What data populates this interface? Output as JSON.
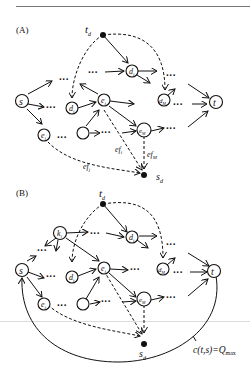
{
  "panels": [
    {
      "id": "A",
      "label": "(A)",
      "nodes": {
        "s": "s",
        "t": "t",
        "td": "t",
        "td_sub": "d",
        "sd": "s",
        "sd_sub": "d",
        "di": "d",
        "di_sub": "i",
        "ei": "e",
        "ei_sub": "i",
        "dj": "d",
        "dj_sub": "j",
        "dM": "d",
        "dM_sub": "M",
        "ej": "e",
        "ej_sub": "j",
        "eM": "e",
        "eM_sub": "M"
      },
      "edge_labels": {
        "efi": "ef",
        "efi_sub": "i",
        "efj": "ef",
        "efj_sub": "j",
        "efM": "ef",
        "efM_sub": "M"
      },
      "dots": "···"
    },
    {
      "id": "B",
      "label": "(B)",
      "nodes": {
        "s": "s",
        "t": "t",
        "td": "t",
        "td_sub": "d",
        "sd": "s",
        "sd_sub": "d",
        "ki": "k",
        "ki_sub": "i",
        "di": "d",
        "di_sub": "i",
        "ei": "e",
        "ei_sub": "i",
        "dj": "d",
        "dj_sub": "j",
        "dM": "d",
        "dM_sub": "M",
        "ej": "e",
        "ej_sub": "j",
        "eM": "e",
        "eM_sub": "M"
      },
      "annotation": {
        "text": "c(t,s)=Q",
        "sub": "max"
      },
      "dots": "···"
    }
  ]
}
